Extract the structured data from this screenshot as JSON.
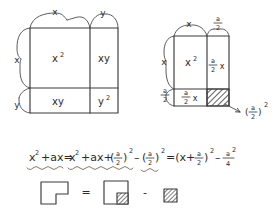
{
  "page": {
    "background_color": "#ffffff",
    "ink_color": "#3a3a3a",
    "underline_color": "#7a6a5a"
  },
  "figure_left": {
    "name": "binomial-square-expansion",
    "description": "Square of side (x+y) partitioned into four regions",
    "top_labels": [
      "x",
      "y"
    ],
    "left_labels": [
      "x",
      "y"
    ],
    "cells": [
      {
        "id": "top-left",
        "label": "x",
        "exponent": "2"
      },
      {
        "id": "top-right",
        "label": "xy",
        "exponent": ""
      },
      {
        "id": "bottom-left",
        "label": "xy",
        "exponent": ""
      },
      {
        "id": "bottom-right",
        "label": "y",
        "exponent": "2"
      }
    ]
  },
  "figure_right": {
    "name": "completing-the-square",
    "description": "Square of side (x + a/2) partitioned with shaded corner",
    "top_labels": [
      {
        "text": "x",
        "kind": "plain"
      },
      {
        "text": "a/2",
        "kind": "fraction",
        "num": "a",
        "den": "2"
      }
    ],
    "left_labels": [
      {
        "text": "x",
        "kind": "plain"
      },
      {
        "text": "a/2",
        "kind": "fraction",
        "num": "a",
        "den": "2"
      }
    ],
    "cells": [
      {
        "id": "top-left",
        "label": "x",
        "exponent": "2",
        "kind": "plain"
      },
      {
        "id": "top-right",
        "num": "a",
        "den": "2",
        "suffix": "x",
        "kind": "fraction"
      },
      {
        "id": "bottom-left",
        "num": "a",
        "den": "2",
        "suffix": "x",
        "kind": "fraction"
      },
      {
        "id": "bottom-right",
        "label": "",
        "kind": "hatched"
      }
    ],
    "callout": {
      "num": "a",
      "den": "2",
      "exponent": "2",
      "arrow": "arrow-to-hatched-square"
    }
  },
  "equation": {
    "full_text": "x² + ax = x² + ax + (a/2)² − (a/2)² = (x + a/2)² − a²/4",
    "terms": [
      {
        "t": "x",
        "sup": "2"
      },
      {
        "t": "+ax="
      },
      {
        "t": "x",
        "sup": "2"
      },
      {
        "t": "+ax+"
      },
      {
        "t": "(a/2)",
        "sup": "2"
      },
      {
        "t": "−"
      },
      {
        "t": "(a/2)",
        "sup": "2"
      },
      {
        "t": "=(x+a/2)",
        "sup": "2"
      },
      {
        "t": "−a²/4"
      }
    ],
    "underline_groups": [
      "x²+ax",
      "x²+ax+(a/2)²",
      "(a/2)²"
    ]
  },
  "shape_row": {
    "name": "gnomon-identity",
    "items": [
      {
        "id": "gnomon",
        "shape": "L-shape",
        "hatched": false
      },
      {
        "id": "equals",
        "shape": "operator",
        "symbol": "="
      },
      {
        "id": "square-with-corner",
        "shape": "square-with-hatched-corner",
        "hatched": true
      },
      {
        "id": "minus",
        "shape": "operator",
        "symbol": "-"
      },
      {
        "id": "hatched-square",
        "shape": "hatched-square",
        "hatched": true
      }
    ]
  }
}
